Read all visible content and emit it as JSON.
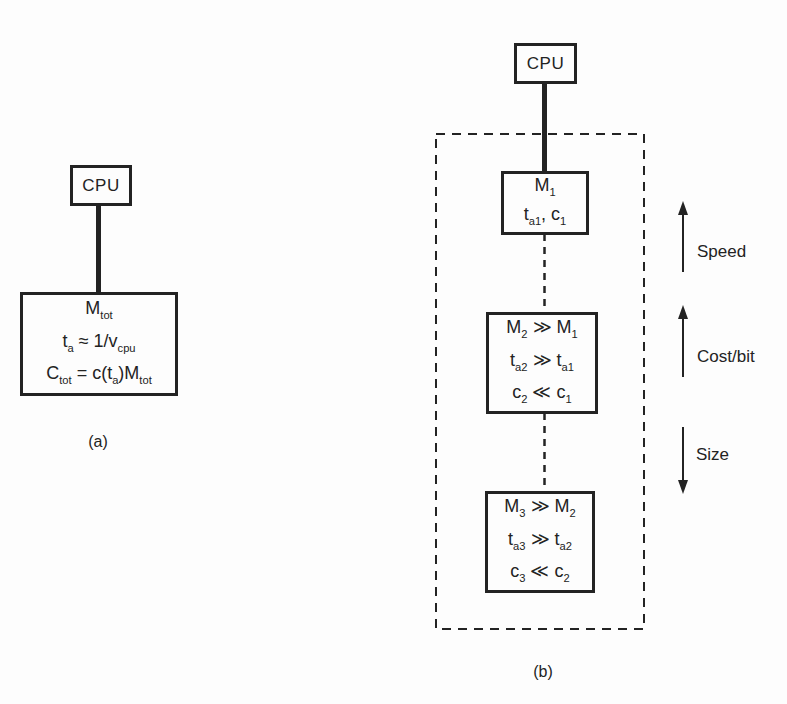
{
  "figure": {
    "paper_color": "#fdfdfd",
    "ink_color": "#232323"
  },
  "diagram_a": {
    "cpu_label": "CPU",
    "memory_box": {
      "lines": [
        [
          {
            "t": "M"
          },
          {
            "t": "tot",
            "sub": true
          }
        ],
        [
          {
            "t": "t"
          },
          {
            "t": "a",
            "sub": true
          },
          {
            "t": " ≈ 1/v"
          },
          {
            "t": "cpu",
            "sub": true
          }
        ],
        [
          {
            "t": "C"
          },
          {
            "t": "tot",
            "sub": true
          },
          {
            "t": " = c(t"
          },
          {
            "t": "a",
            "sub": true
          },
          {
            "t": ")M"
          },
          {
            "t": "tot",
            "sub": true
          }
        ]
      ]
    },
    "caption": "(a)"
  },
  "diagram_b": {
    "cpu_label": "CPU",
    "level1": {
      "lines": [
        [
          {
            "t": "M"
          },
          {
            "t": "1",
            "sub": true
          }
        ],
        [
          {
            "t": "t"
          },
          {
            "t": "a1",
            "sub": true
          },
          {
            "t": ", c"
          },
          {
            "t": "1",
            "sub": true
          }
        ]
      ]
    },
    "level2": {
      "lines": [
        [
          {
            "t": "M"
          },
          {
            "t": "2",
            "sub": true
          },
          {
            "t": " ≫ M"
          },
          {
            "t": "1",
            "sub": true
          }
        ],
        [
          {
            "t": "t"
          },
          {
            "t": "a2",
            "sub": true
          },
          {
            "t": " ≫ t"
          },
          {
            "t": "a1",
            "sub": true
          }
        ],
        [
          {
            "t": "c"
          },
          {
            "t": "2",
            "sub": true
          },
          {
            "t": " ≪ c"
          },
          {
            "t": "1",
            "sub": true
          }
        ]
      ]
    },
    "level3": {
      "lines": [
        [
          {
            "t": "M"
          },
          {
            "t": "3",
            "sub": true
          },
          {
            "t": " ≫ M"
          },
          {
            "t": "2",
            "sub": true
          }
        ],
        [
          {
            "t": "t"
          },
          {
            "t": "a3",
            "sub": true
          },
          {
            "t": " ≫ t"
          },
          {
            "t": "a2",
            "sub": true
          }
        ],
        [
          {
            "t": "c"
          },
          {
            "t": "3",
            "sub": true
          },
          {
            "t": " ≪ c"
          },
          {
            "t": "2",
            "sub": true
          }
        ]
      ]
    },
    "caption": "(b)"
  },
  "tradeoff_axes": {
    "speed": {
      "label": "Speed",
      "direction": "up"
    },
    "cost_per_bit": {
      "label": "Cost/bit",
      "direction": "up"
    },
    "size": {
      "label": "Size",
      "direction": "down"
    }
  }
}
